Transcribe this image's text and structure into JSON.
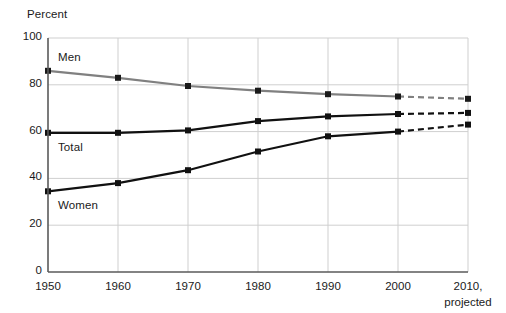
{
  "chart_data": {
    "type": "line",
    "title": "",
    "ylabel": "Percent",
    "xlabel": "",
    "ylim": [
      0,
      100
    ],
    "yticks": [
      0,
      20,
      40,
      60,
      80,
      100
    ],
    "ytick_labels": [
      "0",
      "20",
      "40",
      "60",
      "80",
      "100"
    ],
    "x": [
      1950,
      1960,
      1970,
      1980,
      1990,
      2000,
      2010
    ],
    "xtick_labels": [
      "1950",
      "1960",
      "1970",
      "1980",
      "1990",
      "2000",
      "2010,"
    ],
    "xtick_sublabel": "projected",
    "grid": true,
    "legend_position": "inline-labels",
    "projection_note": "Values at 2010 are projected; segments from 2000 to 2010 are drawn dashed.",
    "series": [
      {
        "name": "Men",
        "color": "#808080",
        "label_x": 1950,
        "values": [
          86,
          83,
          79.5,
          77.5,
          76,
          75,
          74
        ],
        "projected_from": 2000
      },
      {
        "name": "Total",
        "color": "#111111",
        "label_x": 1950,
        "values": [
          59.5,
          59.5,
          60.5,
          64.5,
          66.5,
          67.5,
          68
        ],
        "projected_from": 2000
      },
      {
        "name": "Women",
        "color": "#111111",
        "label_x": 1950,
        "values": [
          34.5,
          38,
          43.5,
          51.5,
          58,
          60,
          63
        ],
        "projected_from": 2000
      }
    ]
  },
  "axes": {
    "plot_left": 48,
    "plot_right": 468,
    "plot_top": 38,
    "plot_bottom": 272,
    "axis_color": "#5a5a5a",
    "grid_color": "#cfcfcf"
  }
}
